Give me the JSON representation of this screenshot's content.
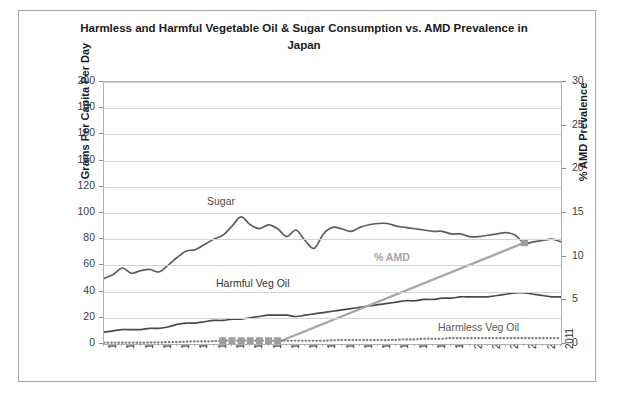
{
  "chart_data": {
    "type": "line",
    "title": "Harmless and Harmful Vegetable Oil & Sugar Consumption vs. AMD Prevalence in Japan",
    "title_line1": "Harmless and Harmful Vegetable Oil & Sugar Consumption vs. AMD Prevalence in",
    "title_line2": "Japan",
    "xlabel": "",
    "ylabel": "Grams Per Capita Per Day",
    "ylabel_secondary": "% AMD Prevalence",
    "ylim": [
      0,
      200
    ],
    "ylim_secondary": [
      0,
      30
    ],
    "yticks": [
      0,
      20,
      40,
      60,
      80,
      100,
      120,
      140,
      160,
      180,
      200
    ],
    "yticks_secondary": [
      0,
      5,
      10,
      15,
      20,
      25,
      30
    ],
    "grid": true,
    "legend_position": "inline-annotations",
    "x": [
      1961,
      1962,
      1963,
      1964,
      1965,
      1966,
      1967,
      1968,
      1969,
      1970,
      1971,
      1972,
      1973,
      1974,
      1975,
      1976,
      1977,
      1978,
      1979,
      1980,
      1981,
      1982,
      1983,
      1984,
      1985,
      1986,
      1987,
      1988,
      1989,
      1990,
      1991,
      1992,
      1993,
      1994,
      1995,
      1996,
      1997,
      1998,
      1999,
      2000,
      2001,
      2002,
      2003,
      2004,
      2005,
      2006,
      2007,
      2008,
      2009,
      2010,
      2011
    ],
    "xticks": [
      1961,
      1963,
      1965,
      1967,
      1969,
      1971,
      1973,
      1975,
      1977,
      1979,
      1981,
      1983,
      1985,
      1987,
      1989,
      1991,
      1993,
      1995,
      1997,
      1999,
      2001,
      2003,
      2005,
      2007,
      2009,
      2011
    ],
    "series": [
      {
        "name": "Sugar",
        "axis": "left",
        "color": "#5e5e5e",
        "style": "solid",
        "values": [
          50,
          53,
          58,
          54,
          56,
          57,
          55,
          60,
          66,
          71,
          72,
          76,
          80,
          83,
          90,
          97,
          91,
          88,
          91,
          88,
          82,
          87,
          79,
          73,
          84,
          89,
          88,
          86,
          89,
          91,
          92,
          92,
          90,
          89,
          88,
          87,
          86,
          86,
          84,
          84,
          82,
          82,
          83,
          84,
          85,
          83,
          77,
          78,
          79,
          80,
          78
        ]
      },
      {
        "name": "Harmful Veg Oil",
        "axis": "left",
        "color": "#4a4a4a",
        "style": "solid",
        "values": [
          9,
          10,
          11,
          11,
          11,
          12,
          12,
          13,
          15,
          16,
          16,
          17,
          18,
          18,
          19,
          19,
          20,
          21,
          22,
          22,
          22,
          21,
          22,
          23,
          24,
          25,
          26,
          27,
          28,
          29,
          30,
          31,
          32,
          33,
          33,
          34,
          34,
          35,
          35,
          36,
          36,
          36,
          36,
          37,
          38,
          39,
          39,
          38,
          37,
          36,
          36
        ]
      },
      {
        "name": "% AMD",
        "axis": "right",
        "color": "#a6a6a6",
        "style": "solid-thick",
        "values": [
          null,
          null,
          null,
          null,
          null,
          null,
          null,
          null,
          null,
          null,
          null,
          null,
          null,
          null,
          null,
          null,
          null,
          null,
          null,
          0.2,
          null,
          null,
          null,
          null,
          null,
          null,
          null,
          null,
          null,
          null,
          null,
          null,
          null,
          null,
          null,
          null,
          null,
          null,
          null,
          null,
          null,
          null,
          null,
          null,
          null,
          null,
          11.6,
          null,
          null,
          null,
          null
        ],
        "marker_points": [
          {
            "x": 2007,
            "y": 11.6
          }
        ],
        "note": "straight line from 1980 at ~0.2% to 2007 at ~11.6%"
      },
      {
        "name": "Harmless Veg Oil",
        "axis": "left",
        "color": "#808080",
        "style": "dotted",
        "values": [
          1,
          1,
          1,
          1,
          1,
          1.2,
          1.2,
          1.5,
          1.5,
          1.8,
          2,
          2,
          2.2,
          2.5,
          2.5,
          2.5,
          2.5,
          2.5,
          2.5,
          2.5,
          2.5,
          2.5,
          2.5,
          2.5,
          2.5,
          2.8,
          3,
          3,
          3,
          3,
          3,
          3,
          3.2,
          3.5,
          3.5,
          4,
          4,
          4,
          4.5,
          4.5,
          4.5,
          4.5,
          4.5,
          4.5,
          4.5,
          4.5,
          4.5,
          4.5,
          4.5,
          4.5,
          4.5
        ],
        "marker_years": [
          1974,
          1975,
          1976,
          1977,
          1978,
          1979,
          1980
        ]
      }
    ],
    "annotations": [
      {
        "text": "Sugar",
        "series": "Sugar"
      },
      {
        "text": "Harmful Veg Oil",
        "series": "Harmful Veg Oil"
      },
      {
        "text": "% AMD",
        "series": "% AMD"
      },
      {
        "text": "Harmless Veg Oil",
        "series": "Harmless Veg Oil"
      }
    ]
  }
}
